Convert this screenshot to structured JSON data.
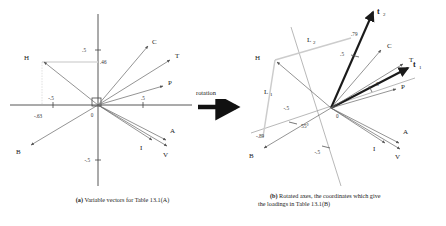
{
  "figure": {
    "rotation_label": "rotation",
    "panel_a": {
      "caption_tag": "(a)",
      "caption_text": " Variable vectors for Table 13.1(A)",
      "origin_label": "0",
      "tick_labels": [
        ".5",
        "-.5",
        "-.5",
        ".5",
        "-.63",
        ".46"
      ],
      "vectors": [
        {
          "name": "H",
          "x": -0.63,
          "y": 0.46
        },
        {
          "name": "B",
          "x": -0.62,
          "y": -0.42
        },
        {
          "name": "C",
          "x": 0.52,
          "y": 0.6
        },
        {
          "name": "T",
          "x": 0.7,
          "y": 0.48
        },
        {
          "name": "P",
          "x": 0.7,
          "y": 0.24
        },
        {
          "name": "I",
          "x": 0.52,
          "y": -0.34
        },
        {
          "name": "A",
          "x": 0.66,
          "y": -0.36
        },
        {
          "name": "V",
          "x": 0.66,
          "y": -0.44
        }
      ]
    },
    "panel_b": {
      "caption_tag": "(b)",
      "caption_line1": " Rotated axes, the coordinates which give",
      "caption_line2": "the loadings in Table 13.1(B)",
      "origin_label": "0",
      "angle_label": "55°",
      "rotated_axis_1": "t",
      "rotated_axis_1_sub": "1",
      "rotated_axis_2": "t",
      "rotated_axis_2_sub": "2",
      "loading_1": "L",
      "loading_1_sub": "1",
      "loading_2": "L",
      "loading_2_sub": "2",
      "tick_labels": [
        ".5",
        "-.5",
        "-.5",
        ".5",
        "-.89",
        ".79"
      ],
      "vectors": [
        {
          "name": "H",
          "x": -0.63,
          "y": 0.46
        },
        {
          "name": "B",
          "x": -0.62,
          "y": -0.42
        },
        {
          "name": "C",
          "x": 0.52,
          "y": 0.6
        },
        {
          "name": "T",
          "x": 0.7,
          "y": 0.48
        },
        {
          "name": "P",
          "x": 0.7,
          "y": 0.24
        },
        {
          "name": "I",
          "x": 0.52,
          "y": -0.34
        },
        {
          "name": "A",
          "x": 0.66,
          "y": -0.36
        },
        {
          "name": "V",
          "x": 0.66,
          "y": -0.44
        }
      ]
    },
    "colors": {
      "vector": "#555555",
      "axis": "#444444",
      "rotated_axis": "#222222",
      "loading_line": "#c8c8c8",
      "arrow_black": "#111111"
    }
  }
}
